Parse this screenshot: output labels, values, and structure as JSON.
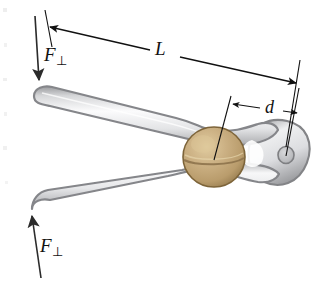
{
  "figure": {
    "background_color": "#ffffff",
    "labels": {
      "force_top": {
        "symbol": "F",
        "subscript": "⊥",
        "name": "perpendicular-force-top"
      },
      "force_bottom": {
        "symbol": "F",
        "subscript": "⊥",
        "name": "perpendicular-force-bottom"
      },
      "length": {
        "symbol": "L",
        "subscript": "",
        "name": "handle-length-dimension"
      },
      "distance": {
        "symbol": "d",
        "subscript": "",
        "name": "nut-to-pivot-dimension"
      }
    },
    "colors": {
      "ink": "#111111",
      "metal_outline": "#8b8b8d",
      "metal_dark": "#6f7073",
      "metal_light": "#f4f4f5",
      "metal_mid": "#d8d9db",
      "nut_light": "#d8c092",
      "nut_mid": "#c2a474",
      "nut_dark": "#9a7f52",
      "nut_outline": "#7d6439"
    },
    "objects": [
      {
        "name": "upper-handle",
        "type": "metal-arm"
      },
      {
        "name": "lower-handle",
        "type": "metal-arm"
      },
      {
        "name": "pivot-head",
        "type": "metal-pivot"
      },
      {
        "name": "pivot-hole",
        "type": "hole"
      },
      {
        "name": "walnut",
        "type": "nut"
      }
    ],
    "dimension_lines": [
      {
        "name": "length-dimension-line",
        "label": "L",
        "arrowheads": "both"
      },
      {
        "name": "distance-dimension-line",
        "label": "d",
        "arrowheads": "both"
      }
    ],
    "force_arrows": [
      {
        "name": "force-arrow-top",
        "direction": "down",
        "label": "F⊥"
      },
      {
        "name": "force-arrow-bottom",
        "direction": "up",
        "label": "F⊥"
      }
    ]
  }
}
